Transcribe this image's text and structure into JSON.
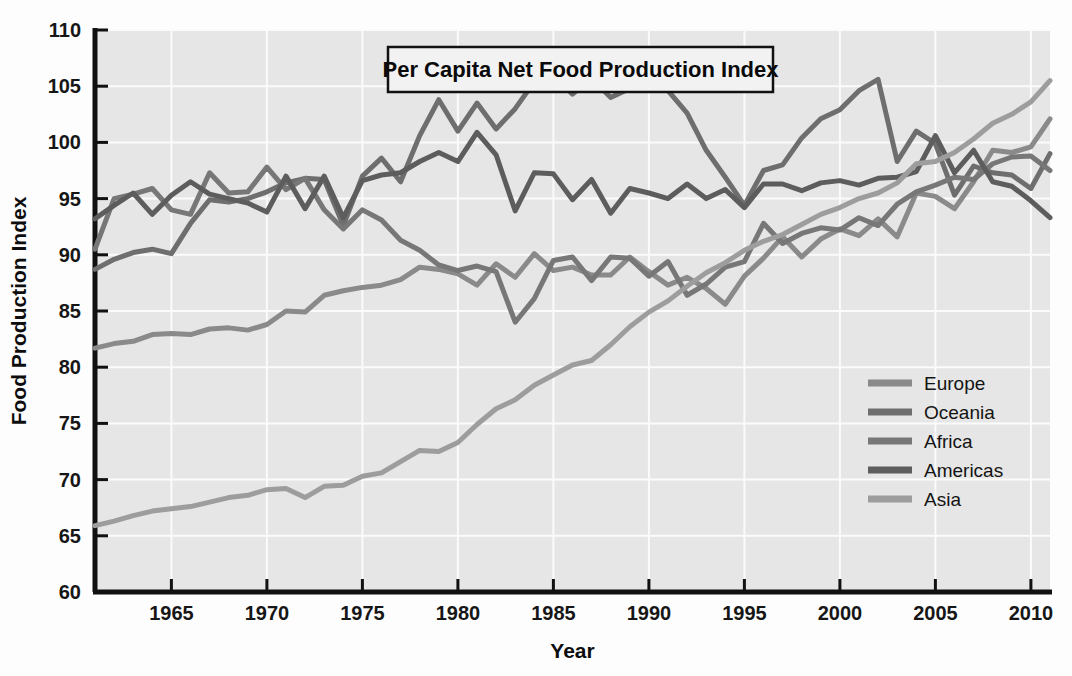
{
  "chart_data": {
    "type": "line",
    "title": "Per Capita Net Food Production Index",
    "xlabel": "Year",
    "ylabel": "Food Production Index",
    "xlim": [
      1961,
      2011
    ],
    "ylim": [
      60,
      110
    ],
    "xticks": [
      1965,
      1970,
      1975,
      1980,
      1985,
      1990,
      1995,
      2000,
      2005,
      2010
    ],
    "yticks": [
      60,
      65,
      70,
      75,
      80,
      85,
      90,
      95,
      100,
      105,
      110
    ],
    "grid": true,
    "legend_position": "right-middle",
    "plot_background": "#e6e6e6",
    "x": [
      1961,
      1962,
      1963,
      1964,
      1965,
      1966,
      1967,
      1968,
      1969,
      1970,
      1971,
      1972,
      1973,
      1974,
      1975,
      1976,
      1977,
      1978,
      1979,
      1980,
      1981,
      1982,
      1983,
      1984,
      1985,
      1986,
      1987,
      1988,
      1989,
      1990,
      1991,
      1992,
      1993,
      1994,
      1995,
      1996,
      1997,
      1998,
      1999,
      2000,
      2001,
      2002,
      2003,
      2004,
      2005,
      2006,
      2007,
      2008,
      2009,
      2010,
      2011
    ],
    "series": [
      {
        "name": "Europe",
        "color": "#8a8a8a",
        "values": [
          81.7,
          82.1,
          82.3,
          82.9,
          83.0,
          82.9,
          83.4,
          83.5,
          83.3,
          83.8,
          85.0,
          84.9,
          86.4,
          86.8,
          87.1,
          87.3,
          87.8,
          88.9,
          88.7,
          88.3,
          87.3,
          89.2,
          88.0,
          90.1,
          88.6,
          88.9,
          88.2,
          88.2,
          89.8,
          88.5,
          87.3,
          88.0,
          87.0,
          85.6,
          88.1,
          89.7,
          91.6,
          89.8,
          91.4,
          92.3,
          91.7,
          93.2,
          91.6,
          95.5,
          95.2,
          94.1,
          96.5,
          99.3,
          99.1,
          99.6,
          102.1
        ]
      },
      {
        "name": "Oceania",
        "color": "#6e6e6e",
        "values": [
          88.7,
          89.6,
          90.2,
          90.5,
          90.1,
          92.8,
          94.9,
          94.7,
          95.0,
          95.6,
          96.4,
          96.8,
          96.7,
          92.6,
          97.0,
          98.6,
          96.5,
          100.6,
          103.8,
          101.0,
          103.5,
          101.2,
          103.0,
          105.4,
          105.9,
          104.3,
          105.7,
          104.0,
          104.8,
          106.1,
          104.6,
          102.6,
          99.3,
          96.9,
          94.4,
          97.5,
          98.0,
          100.4,
          102.1,
          102.9,
          104.6,
          105.6,
          98.3,
          101.0,
          99.9,
          95.3,
          97.9,
          97.3,
          97.1,
          95.9,
          99.0
        ]
      },
      {
        "name": "Africa",
        "color": "#777777",
        "values": [
          90.5,
          95.0,
          95.4,
          95.9,
          94.0,
          93.6,
          97.3,
          95.5,
          95.6,
          97.8,
          95.8,
          96.8,
          94.0,
          92.3,
          94.0,
          93.1,
          91.3,
          90.4,
          89.1,
          88.6,
          89.0,
          88.5,
          84.0,
          86.1,
          89.5,
          89.8,
          87.7,
          89.8,
          89.7,
          88.1,
          89.4,
          86.4,
          87.4,
          88.9,
          89.4,
          92.8,
          91.0,
          91.9,
          92.4,
          92.2,
          93.3,
          92.6,
          94.5,
          95.6,
          96.2,
          96.9,
          96.7,
          98.1,
          98.7,
          98.8,
          97.5
        ]
      },
      {
        "name": "Americas",
        "color": "#5d5d5d",
        "values": [
          93.2,
          94.4,
          95.5,
          93.6,
          95.3,
          96.5,
          95.4,
          95.0,
          94.6,
          93.8,
          97.0,
          94.1,
          97.0,
          93.3,
          96.6,
          97.1,
          97.3,
          98.3,
          99.1,
          98.3,
          100.9,
          98.9,
          93.9,
          97.3,
          97.2,
          94.9,
          96.7,
          93.7,
          95.9,
          95.5,
          95.0,
          96.3,
          95.0,
          95.8,
          94.2,
          96.3,
          96.3,
          95.7,
          96.4,
          96.6,
          96.2,
          96.8,
          96.9,
          97.4,
          100.6,
          97.3,
          99.3,
          96.5,
          96.1,
          94.8,
          93.3
        ]
      },
      {
        "name": "Asia",
        "color": "#9d9d9d",
        "values": [
          65.9,
          66.3,
          66.8,
          67.2,
          67.4,
          67.6,
          68.0,
          68.4,
          68.6,
          69.1,
          69.2,
          68.4,
          69.4,
          69.5,
          70.3,
          70.6,
          71.6,
          72.6,
          72.5,
          73.3,
          74.9,
          76.3,
          77.1,
          78.4,
          79.3,
          80.2,
          80.6,
          82.0,
          83.6,
          84.9,
          85.9,
          87.2,
          88.4,
          89.3,
          90.4,
          91.2,
          91.8,
          92.7,
          93.6,
          94.2,
          95.0,
          95.5,
          96.4,
          98.1,
          98.3,
          99.1,
          100.3,
          101.7,
          102.5,
          103.6,
          105.5
        ]
      }
    ]
  },
  "legend": {
    "items": [
      {
        "label": "Europe"
      },
      {
        "label": "Oceania"
      },
      {
        "label": "Africa"
      },
      {
        "label": "Americas"
      },
      {
        "label": "Asia"
      }
    ]
  }
}
